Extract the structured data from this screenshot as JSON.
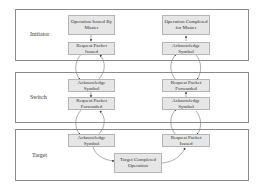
{
  "diagram": {
    "title": "",
    "layers": [
      {
        "id": "initiator",
        "label": "Initiator"
      },
      {
        "id": "switch",
        "label": "Switch"
      },
      {
        "id": "target",
        "label": "Target"
      }
    ],
    "nodes": {
      "op_issued": "Operation Issued By Master",
      "req_issued_init": "Request Packet Issued",
      "op_completed": "Operation Completed for Master",
      "ack_init": "Acknowledge Symbol",
      "ack_switch_left": "Acknowledge Symbol",
      "req_forwarded_left": "Request Packet Forwarded",
      "req_forwarded_right": "Request Packet Forwarded",
      "ack_switch_right": "Acknowledge Symbol",
      "ack_target": "Acknowledge Symbol",
      "target_completed": "Target Completed Operation",
      "req_issued_target": "Request Packet Issued"
    },
    "edges": [
      [
        "op_issued",
        "req_issued_init"
      ],
      [
        "req_issued_init",
        "ack_switch_left"
      ],
      [
        "ack_switch_left",
        "req_issued_init"
      ],
      [
        "ack_switch_left",
        "req_forwarded_left"
      ],
      [
        "req_forwarded_left",
        "ack_target"
      ],
      [
        "ack_target",
        "req_forwarded_left"
      ],
      [
        "ack_target",
        "target_completed"
      ],
      [
        "target_completed",
        "req_issued_target"
      ],
      [
        "req_issued_target",
        "ack_switch_right"
      ],
      [
        "ack_switch_right",
        "req_issued_target"
      ],
      [
        "ack_switch_right",
        "req_forwarded_right"
      ],
      [
        "req_forwarded_right",
        "ack_init"
      ],
      [
        "ack_init",
        "req_forwarded_right"
      ],
      [
        "ack_init",
        "op_completed"
      ]
    ],
    "colors": {
      "node_fill": "#e6e6e6",
      "panel_border": "#8a8a8a",
      "edge": "#777777"
    }
  }
}
